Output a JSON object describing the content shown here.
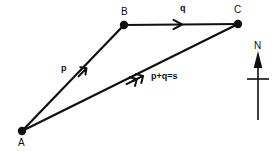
{
  "diagram": {
    "background_color": "#ffffff",
    "stroke_color": "#101010",
    "vertices": [
      {
        "id": "A",
        "label": "A",
        "x": 22,
        "y": 131
      },
      {
        "id": "B",
        "label": "B",
        "x": 124,
        "y": 25
      },
      {
        "id": "C",
        "label": "C",
        "x": 238,
        "y": 24
      }
    ],
    "vectors": [
      {
        "id": "p",
        "label": "p",
        "from": "A",
        "to": "B",
        "arrowheads": 1,
        "arrow_position": 0.62
      },
      {
        "id": "q",
        "label": "q",
        "from": "B",
        "to": "C",
        "arrowheads": 1,
        "arrow_position": 0.5
      },
      {
        "id": "s",
        "label": "p+q=s",
        "from": "A",
        "to": "C",
        "arrowheads": 2,
        "arrow_position": 0.58
      }
    ],
    "compass": {
      "label": "N",
      "direction": "north",
      "x": 258,
      "top_y": 52,
      "bottom_y": 120,
      "crossbar_y": 79,
      "crossbar_half_width": 11
    }
  }
}
